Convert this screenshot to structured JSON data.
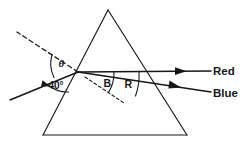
{
  "figure": {
    "kind": "optics-ray-diagram",
    "background": "#ffffff",
    "ink": "#17171a",
    "width": 245,
    "height": 145
  },
  "labels": {
    "theta": "θ",
    "incidence_angle": "40°",
    "blue_arc": "B",
    "red_arc": "R",
    "red_ray": "Red",
    "blue_ray": "Blue"
  },
  "geometry": {
    "prism": {
      "apex": [
        108,
        10
      ],
      "base_left": [
        43,
        135
      ],
      "base_right": [
        187,
        135
      ]
    },
    "incidence_point": [
      78,
      72
    ],
    "normal_dashed_end": [
      17,
      32
    ],
    "incident_ray_start": [
      10,
      100
    ],
    "red_exit": [
      211,
      71
    ],
    "blue_exit": [
      211,
      92
    ],
    "internal_dash_end": [
      124,
      103
    ]
  },
  "elements": {
    "prism_name": "triangular-prism",
    "normal_name": "normal-dashed-line",
    "incident_name": "incident-ray",
    "red_name": "red-refracted-ray",
    "blue_name": "blue-refracted-ray"
  }
}
